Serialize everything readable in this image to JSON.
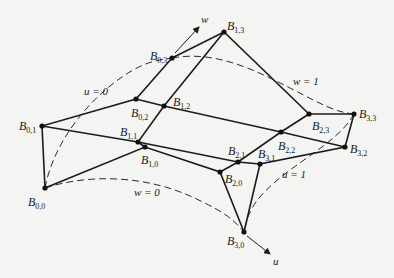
{
  "figure": {
    "type": "bicubic Bezier surface control net",
    "points": [
      {
        "id": "B00",
        "label": "B",
        "sub": "0,0",
        "x": 45,
        "y": 188,
        "lx": 28,
        "ly": 206
      },
      {
        "id": "B01",
        "label": "B",
        "sub": "0,1",
        "x": 42,
        "y": 126,
        "lx": 19,
        "ly": 130
      },
      {
        "id": "B02",
        "label": "B",
        "sub": "0,2",
        "x": 136,
        "y": 99,
        "lx": 131,
        "ly": 117
      },
      {
        "id": "B03",
        "label": "B",
        "sub": "0,3",
        "x": 172,
        "y": 58,
        "lx": 150,
        "ly": 60
      },
      {
        "id": "B10",
        "label": "B",
        "sub": "1,0",
        "x": 145,
        "y": 147,
        "lx": 141,
        "ly": 164
      },
      {
        "id": "B11",
        "label": "B",
        "sub": "1,1",
        "x": 138,
        "y": 142,
        "lx": 120,
        "ly": 136
      },
      {
        "id": "B12",
        "label": "B",
        "sub": "1,2",
        "x": 164,
        "y": 106,
        "lx": 173,
        "ly": 106
      },
      {
        "id": "B13",
        "label": "B",
        "sub": "1,3",
        "x": 224,
        "y": 32,
        "lx": 227,
        "ly": 30
      },
      {
        "id": "B20",
        "label": "B",
        "sub": "2,0",
        "x": 220,
        "y": 172,
        "lx": 225,
        "ly": 183
      },
      {
        "id": "B21",
        "label": "B",
        "sub": "2,1",
        "x": 238,
        "y": 162,
        "lx": 228,
        "ly": 155
      },
      {
        "id": "B22",
        "label": "B",
        "sub": "2,2",
        "x": 281,
        "y": 132,
        "lx": 278,
        "ly": 150
      },
      {
        "id": "B23",
        "label": "B",
        "sub": "2,3",
        "x": 309,
        "y": 114,
        "lx": 312,
        "ly": 130
      },
      {
        "id": "B30",
        "label": "B",
        "sub": "3,0",
        "x": 244,
        "y": 232,
        "lx": 227,
        "ly": 245
      },
      {
        "id": "B31",
        "label": "B",
        "sub": "3,1",
        "x": 260,
        "y": 164,
        "lx": 258,
        "ly": 158
      },
      {
        "id": "B32",
        "label": "B",
        "sub": "3,2",
        "x": 345,
        "y": 147,
        "lx": 350,
        "ly": 153
      },
      {
        "id": "B33",
        "label": "B",
        "sub": "3,3",
        "x": 354,
        "y": 114,
        "lx": 359,
        "ly": 118
      }
    ],
    "net_lines": [
      [
        "B00",
        "B10",
        "B20",
        "B30"
      ],
      [
        "B01",
        "B11",
        "B21",
        "B31"
      ],
      [
        "B02",
        "B12",
        "B22",
        "B32"
      ],
      [
        "B03",
        "B13",
        "B23",
        "B33"
      ],
      [
        "B00",
        "B01",
        "B02",
        "B03"
      ],
      [
        "B10",
        "B11",
        "B12",
        "B13"
      ],
      [
        "B20",
        "B21",
        "B22",
        "B23"
      ],
      [
        "B30",
        "B31",
        "B32",
        "B33"
      ]
    ],
    "boundary_curves": [
      {
        "name": "u=0",
        "text": "u = 0",
        "lx": 84,
        "ly": 95
      },
      {
        "name": "u=1",
        "text": "u = 1",
        "lx": 282,
        "ly": 178
      },
      {
        "name": "w=0",
        "text": "w = 0",
        "lx": 134,
        "ly": 196
      },
      {
        "name": "w=1",
        "text": "w = 1",
        "lx": 293,
        "ly": 85
      }
    ],
    "axes": [
      {
        "name": "w",
        "text": "w",
        "lx": 201,
        "ly": 23
      },
      {
        "name": "u",
        "text": "u",
        "lx": 273,
        "ly": 265
      }
    ]
  }
}
